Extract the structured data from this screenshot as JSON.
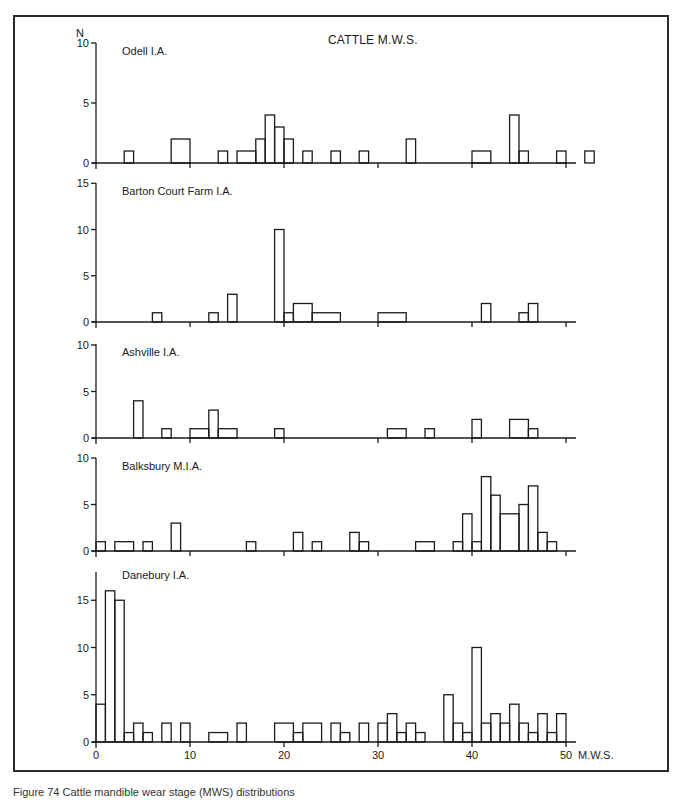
{
  "figure": {
    "title": "CATTLE M.W.S.",
    "y_axis_label": "N",
    "x_axis_label": "M.W.S.",
    "caption": "Figure 74 Cattle mandible wear stage (MWS) distributions"
  },
  "chart_data": [
    {
      "type": "bar",
      "title": "Odell I.A.",
      "xlabel": "M.W.S.",
      "ylabel": "N",
      "ylim": [
        0,
        10
      ],
      "yticks": [
        0,
        5,
        10
      ],
      "xlim": [
        0,
        55
      ],
      "bars": [
        {
          "x0": 3,
          "x1": 4,
          "n": 1
        },
        {
          "x0": 8,
          "x1": 10,
          "n": 2
        },
        {
          "x0": 13,
          "x1": 14,
          "n": 1
        },
        {
          "x0": 15,
          "x1": 17,
          "n": 1
        },
        {
          "x0": 17,
          "x1": 18,
          "n": 2
        },
        {
          "x0": 18,
          "x1": 19,
          "n": 4
        },
        {
          "x0": 19,
          "x1": 20,
          "n": 3
        },
        {
          "x0": 20,
          "x1": 21,
          "n": 2
        },
        {
          "x0": 22,
          "x1": 23,
          "n": 1
        },
        {
          "x0": 25,
          "x1": 26,
          "n": 1
        },
        {
          "x0": 28,
          "x1": 29,
          "n": 1
        },
        {
          "x0": 33,
          "x1": 34,
          "n": 2
        },
        {
          "x0": 40,
          "x1": 42,
          "n": 1
        },
        {
          "x0": 44,
          "x1": 45,
          "n": 4
        },
        {
          "x0": 45,
          "x1": 46,
          "n": 1
        },
        {
          "x0": 49,
          "x1": 50,
          "n": 1
        },
        {
          "x0": 52,
          "x1": 53,
          "n": 1
        }
      ]
    },
    {
      "type": "bar",
      "title": "Barton Court Farm I.A.",
      "xlabel": "M.W.S.",
      "ylabel": "N",
      "ylim": [
        0,
        15
      ],
      "yticks": [
        0,
        5,
        10,
        15
      ],
      "xlim": [
        0,
        55
      ],
      "bars": [
        {
          "x0": 6,
          "x1": 7,
          "n": 1
        },
        {
          "x0": 12,
          "x1": 13,
          "n": 1
        },
        {
          "x0": 14,
          "x1": 15,
          "n": 3
        },
        {
          "x0": 19,
          "x1": 20,
          "n": 10
        },
        {
          "x0": 20,
          "x1": 21,
          "n": 1
        },
        {
          "x0": 21,
          "x1": 23,
          "n": 2
        },
        {
          "x0": 23,
          "x1": 26,
          "n": 1
        },
        {
          "x0": 30,
          "x1": 33,
          "n": 1
        },
        {
          "x0": 41,
          "x1": 42,
          "n": 2
        },
        {
          "x0": 45,
          "x1": 46,
          "n": 1
        },
        {
          "x0": 46,
          "x1": 47,
          "n": 2
        }
      ]
    },
    {
      "type": "bar",
      "title": "Ashville I.A.",
      "xlabel": "M.W.S.",
      "ylabel": "N",
      "ylim": [
        0,
        10
      ],
      "yticks": [
        0,
        5,
        10
      ],
      "xlim": [
        0,
        55
      ],
      "bars": [
        {
          "x0": 4,
          "x1": 5,
          "n": 4
        },
        {
          "x0": 7,
          "x1": 8,
          "n": 1
        },
        {
          "x0": 10,
          "x1": 12,
          "n": 1
        },
        {
          "x0": 12,
          "x1": 13,
          "n": 3
        },
        {
          "x0": 13,
          "x1": 15,
          "n": 1
        },
        {
          "x0": 19,
          "x1": 20,
          "n": 1
        },
        {
          "x0": 31,
          "x1": 33,
          "n": 1
        },
        {
          "x0": 35,
          "x1": 36,
          "n": 1
        },
        {
          "x0": 40,
          "x1": 41,
          "n": 2
        },
        {
          "x0": 44,
          "x1": 46,
          "n": 2
        },
        {
          "x0": 46,
          "x1": 47,
          "n": 1
        }
      ]
    },
    {
      "type": "bar",
      "title": "Balksbury M.I.A.",
      "xlabel": "M.W.S.",
      "ylabel": "N",
      "ylim": [
        0,
        10
      ],
      "yticks": [
        0,
        5,
        10
      ],
      "xlim": [
        0,
        55
      ],
      "bars": [
        {
          "x0": 0,
          "x1": 1,
          "n": 1
        },
        {
          "x0": 2,
          "x1": 4,
          "n": 1
        },
        {
          "x0": 5,
          "x1": 6,
          "n": 1
        },
        {
          "x0": 8,
          "x1": 9,
          "n": 3
        },
        {
          "x0": 16,
          "x1": 17,
          "n": 1
        },
        {
          "x0": 21,
          "x1": 22,
          "n": 2
        },
        {
          "x0": 23,
          "x1": 24,
          "n": 1
        },
        {
          "x0": 27,
          "x1": 28,
          "n": 2
        },
        {
          "x0": 28,
          "x1": 29,
          "n": 1
        },
        {
          "x0": 34,
          "x1": 36,
          "n": 1
        },
        {
          "x0": 38,
          "x1": 39,
          "n": 1
        },
        {
          "x0": 39,
          "x1": 40,
          "n": 4
        },
        {
          "x0": 40,
          "x1": 41,
          "n": 1
        },
        {
          "x0": 41,
          "x1": 42,
          "n": 8
        },
        {
          "x0": 42,
          "x1": 43,
          "n": 6
        },
        {
          "x0": 43,
          "x1": 45,
          "n": 4
        },
        {
          "x0": 45,
          "x1": 46,
          "n": 5
        },
        {
          "x0": 46,
          "x1": 47,
          "n": 7
        },
        {
          "x0": 47,
          "x1": 48,
          "n": 2
        },
        {
          "x0": 48,
          "x1": 49,
          "n": 1
        }
      ]
    },
    {
      "type": "bar",
      "title": "Danebury I.A.",
      "xlabel": "M.W.S.",
      "ylabel": "N",
      "ylim": [
        0,
        17
      ],
      "yticks": [
        0,
        5,
        10,
        15
      ],
      "xticks": [
        0,
        10,
        20,
        30,
        40,
        50
      ],
      "xlim": [
        0,
        55
      ],
      "bars": [
        {
          "x0": 0,
          "x1": 1,
          "n": 4
        },
        {
          "x0": 1,
          "x1": 2,
          "n": 16
        },
        {
          "x0": 2,
          "x1": 3,
          "n": 15
        },
        {
          "x0": 3,
          "x1": 4,
          "n": 1
        },
        {
          "x0": 4,
          "x1": 5,
          "n": 2
        },
        {
          "x0": 5,
          "x1": 6,
          "n": 1
        },
        {
          "x0": 7,
          "x1": 8,
          "n": 2
        },
        {
          "x0": 9,
          "x1": 10,
          "n": 2
        },
        {
          "x0": 12,
          "x1": 14,
          "n": 1
        },
        {
          "x0": 15,
          "x1": 16,
          "n": 2
        },
        {
          "x0": 19,
          "x1": 21,
          "n": 2
        },
        {
          "x0": 21,
          "x1": 22,
          "n": 1
        },
        {
          "x0": 22,
          "x1": 24,
          "n": 2
        },
        {
          "x0": 25,
          "x1": 26,
          "n": 2
        },
        {
          "x0": 26,
          "x1": 27,
          "n": 1
        },
        {
          "x0": 28,
          "x1": 29,
          "n": 2
        },
        {
          "x0": 30,
          "x1": 31,
          "n": 2
        },
        {
          "x0": 31,
          "x1": 32,
          "n": 3
        },
        {
          "x0": 32,
          "x1": 33,
          "n": 1
        },
        {
          "x0": 33,
          "x1": 34,
          "n": 2
        },
        {
          "x0": 34,
          "x1": 35,
          "n": 1
        },
        {
          "x0": 37,
          "x1": 38,
          "n": 5
        },
        {
          "x0": 38,
          "x1": 39,
          "n": 2
        },
        {
          "x0": 39,
          "x1": 40,
          "n": 1
        },
        {
          "x0": 40,
          "x1": 41,
          "n": 10
        },
        {
          "x0": 41,
          "x1": 42,
          "n": 2
        },
        {
          "x0": 42,
          "x1": 43,
          "n": 3
        },
        {
          "x0": 43,
          "x1": 44,
          "n": 2
        },
        {
          "x0": 44,
          "x1": 45,
          "n": 4
        },
        {
          "x0": 45,
          "x1": 46,
          "n": 2
        },
        {
          "x0": 46,
          "x1": 47,
          "n": 1
        },
        {
          "x0": 47,
          "x1": 48,
          "n": 3
        },
        {
          "x0": 48,
          "x1": 49,
          "n": 1
        },
        {
          "x0": 49,
          "x1": 50,
          "n": 3
        }
      ]
    }
  ],
  "layout": {
    "x0_px": 96,
    "px_per_unit": 9.4,
    "axis_end_px": 576,
    "panels": [
      {
        "baseline": 163,
        "top": 43,
        "unit_px": 12.0
      },
      {
        "baseline": 322,
        "top": 183,
        "unit_px": 9.25
      },
      {
        "baseline": 438,
        "top": 344,
        "unit_px": 9.3
      },
      {
        "baseline": 551,
        "top": 458,
        "unit_px": 9.3
      },
      {
        "baseline": 742,
        "top": 572,
        "unit_px": 9.45
      }
    ],
    "stroke": "#1a1a1a"
  }
}
